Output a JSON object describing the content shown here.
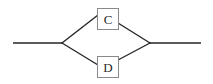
{
  "diagram": {
    "title": "",
    "type": "parallel-branch-flow",
    "canvas": {
      "width": 213,
      "height": 84,
      "background": "#ffffff"
    },
    "style": {
      "edge_color": "#262626",
      "edge_width": 1.4,
      "node_border_color": "#8a8a8a",
      "node_fill": "#ffffff",
      "node_text_color": "#2b2b2b"
    },
    "nodes": [
      {
        "id": "c",
        "label": "C",
        "shape": "rectangle",
        "x": 97,
        "y": 8,
        "width": 22,
        "height": 22,
        "branch": "top"
      },
      {
        "id": "d",
        "label": "D",
        "shape": "rectangle",
        "x": 97,
        "y": 56,
        "width": 22,
        "height": 22,
        "branch": "bottom"
      }
    ],
    "junctions": [
      {
        "id": "split",
        "x": 62,
        "y": 43,
        "role": "left-vertex"
      },
      {
        "id": "merge",
        "x": 150,
        "y": 43,
        "role": "right-vertex"
      }
    ],
    "edges": [
      {
        "id": "edge-in",
        "from": "input-terminal",
        "to": "split",
        "points": "13,43 62,43"
      },
      {
        "id": "edge-split-c",
        "from": "split",
        "to": "c",
        "points": "62,43 97,15"
      },
      {
        "id": "edge-c-merge",
        "from": "c",
        "to": "merge",
        "points": "119,23 150,43"
      },
      {
        "id": "edge-split-d",
        "from": "split",
        "to": "d",
        "points": "62,43 97,65"
      },
      {
        "id": "edge-d-merge",
        "from": "d",
        "to": "merge",
        "points": "119,59 150,43"
      },
      {
        "id": "edge-out",
        "from": "merge",
        "to": "output-terminal",
        "points": "150,43 201,43"
      }
    ],
    "terminals": [
      {
        "id": "input-terminal",
        "x": 13,
        "y": 43,
        "side": "left"
      },
      {
        "id": "output-terminal",
        "x": 201,
        "y": 43,
        "side": "right"
      }
    ]
  }
}
